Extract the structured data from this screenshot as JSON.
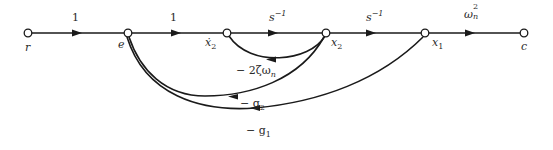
{
  "diagram": {
    "type": "signal-flow-graph",
    "colors": {
      "line": "#1a1a1a",
      "background": "#ffffff",
      "text": "#2a2a2a"
    },
    "nodes": [
      {
        "id": "r",
        "label": "r",
        "x": 28,
        "y": 33
      },
      {
        "id": "e",
        "label": "e",
        "x": 128,
        "y": 33
      },
      {
        "id": "x2dot",
        "label": "ẋ",
        "sub": "2",
        "x": 227,
        "y": 33
      },
      {
        "id": "x2",
        "label": "x",
        "sub": "2",
        "x": 326,
        "y": 33
      },
      {
        "id": "x1",
        "label": "x",
        "sub": "1",
        "x": 425,
        "y": 33
      },
      {
        "id": "c",
        "label": "c",
        "x": 524,
        "y": 33
      }
    ],
    "forward_edges": [
      {
        "from": "r",
        "to": "e",
        "gain": "1"
      },
      {
        "from": "e",
        "to": "x2dot",
        "gain": "1"
      },
      {
        "from": "x2dot",
        "to": "x2",
        "gain_base": "s",
        "gain_sup": "−1"
      },
      {
        "from": "x2",
        "to": "x1",
        "gain_base": "s",
        "gain_sup": "−1"
      },
      {
        "from": "x1",
        "to": "c",
        "gain_base": "ω",
        "gain_sup": "2",
        "gain_sub": "n"
      }
    ],
    "feedback_edges": [
      {
        "from": "x2",
        "to": "x2dot",
        "gain": "− 2ζω",
        "gain_sub": "n"
      },
      {
        "from": "x2",
        "to": "e",
        "gain": "− g",
        "gain_sub": "2"
      },
      {
        "from": "x1",
        "to": "e",
        "gain": "− g",
        "gain_sub": "1"
      }
    ]
  }
}
